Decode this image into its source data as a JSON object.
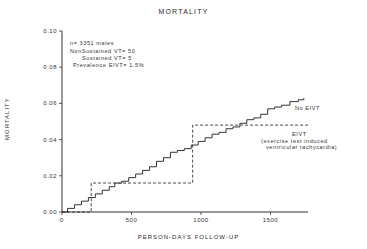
{
  "chart_data": {
    "type": "line",
    "title": "MORTALITY",
    "xlabel": "PERSON-DAYS FOLLOW-UP",
    "ylabel": "MORTALITY",
    "xlim": [
      0,
      1770
    ],
    "ylim": [
      0,
      0.1
    ],
    "x_ticks": [
      "0",
      "500",
      "1000",
      "1500"
    ],
    "y_ticks": [
      "0.00",
      "0.02",
      "0.04",
      "0.06",
      "0.08",
      "0.10"
    ],
    "grid": false,
    "annotations": [
      "n= 3351 males",
      "NonSustained VT= 50",
      "Sustained VT= 5",
      "Prevalence EIVT= 1.5%"
    ],
    "series": [
      {
        "name": "No EIVT",
        "style": "solid-step",
        "x": [
          0,
          40,
          90,
          140,
          190,
          240,
          290,
          340,
          380,
          430,
          480,
          530,
          580,
          630,
          680,
          730,
          780,
          830,
          880,
          930,
          980,
          1030,
          1080,
          1130,
          1180,
          1230,
          1280,
          1330,
          1380,
          1430,
          1480,
          1530,
          1580,
          1640,
          1700,
          1740
        ],
        "y": [
          0.0,
          0.002,
          0.004,
          0.006,
          0.008,
          0.01,
          0.012,
          0.014,
          0.016,
          0.017,
          0.019,
          0.021,
          0.023,
          0.025,
          0.028,
          0.03,
          0.033,
          0.034,
          0.035,
          0.037,
          0.039,
          0.041,
          0.043,
          0.044,
          0.046,
          0.047,
          0.049,
          0.051,
          0.052,
          0.054,
          0.057,
          0.058,
          0.059,
          0.061,
          0.062,
          0.063
        ]
      },
      {
        "name": "EIVT (exercise test induced ventricular tachycardia)",
        "style": "dashed-step",
        "x": [
          0,
          210,
          940,
          1770
        ],
        "y": [
          0.0,
          0.016,
          0.048,
          0.048
        ]
      }
    ],
    "legend": {
      "no_eivt_label": "No EIVT",
      "eivt_label": "EIVT",
      "eivt_desc_line1": "(exercise test induced",
      "eivt_desc_line2": "ventricular tachycardia)"
    }
  }
}
